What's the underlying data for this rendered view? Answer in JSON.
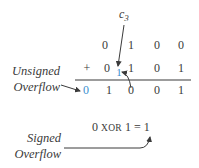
{
  "carry_label": {
    "base": "c",
    "subscript": "3"
  },
  "row1": [
    "0",
    "1",
    "0",
    "0"
  ],
  "operator": "+",
  "row2": [
    "0",
    "1",
    "0",
    "1"
  ],
  "carry_bit": "1",
  "result": [
    "0",
    "1",
    "0",
    "0",
    "1"
  ],
  "unsigned_label": [
    "Unsigned",
    "Overflow"
  ],
  "signed_label": [
    "Signed",
    "Overflow"
  ],
  "xor_expression": {
    "left": "0",
    "op": "XOR",
    "right": "1",
    "equals": "=",
    "result": "1"
  },
  "colors": {
    "highlight": "#3b8fd0",
    "text": "#3a3a3a"
  }
}
